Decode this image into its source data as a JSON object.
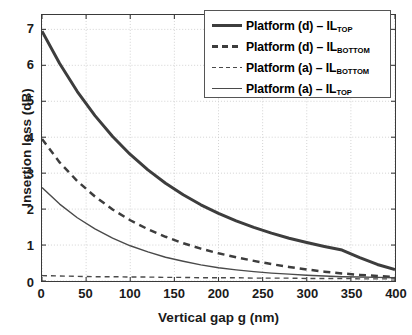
{
  "chart_data": {
    "type": "line",
    "title": "",
    "xlabel": "Vertical gap g (nm)",
    "ylabel": "Insertion loss (dB)",
    "xlim": [
      0,
      400
    ],
    "ylim": [
      0,
      7.4
    ],
    "xticks": [
      0,
      50,
      100,
      150,
      200,
      250,
      300,
      350,
      400
    ],
    "yticks": [
      0,
      1,
      2,
      3,
      4,
      5,
      6,
      7
    ],
    "grid": true,
    "legend_position": "upper right",
    "x": [
      0,
      20,
      40,
      60,
      80,
      100,
      120,
      140,
      160,
      180,
      200,
      220,
      240,
      260,
      280,
      300,
      320,
      340,
      360,
      380,
      400
    ],
    "series": [
      {
        "name": "Platform (d) – IL_TOP",
        "label_main": "Platform (d) – IL",
        "label_sub": "TOP",
        "style": "solid",
        "width": 3.0,
        "color": "#3d3d3d",
        "values": [
          6.95,
          6.05,
          5.27,
          4.6,
          4.02,
          3.52,
          3.09,
          2.72,
          2.4,
          2.12,
          1.88,
          1.67,
          1.49,
          1.33,
          1.19,
          1.07,
          0.96,
          0.86,
          0.65,
          0.46,
          0.32
        ]
      },
      {
        "name": "Platform (d) – IL_BOTTOM",
        "label_main": "Platform (d) – IL",
        "label_sub": "BOTTOM",
        "style": "dashed",
        "width": 2.5,
        "color": "#3d3d3d",
        "values": [
          3.95,
          3.3,
          2.78,
          2.35,
          1.99,
          1.69,
          1.44,
          1.23,
          1.05,
          0.9,
          0.77,
          0.66,
          0.56,
          0.47,
          0.39,
          0.32,
          0.26,
          0.21,
          0.17,
          0.14,
          0.11
        ]
      },
      {
        "name": "Platform (a) – IL_BOTTOM",
        "label_main": "Platform (a) – IL",
        "label_sub": "BOTTOM",
        "style": "dashed",
        "width": 1.4,
        "color": "#4a4a4a",
        "values": [
          0.15,
          0.14,
          0.13,
          0.12,
          0.12,
          0.11,
          0.11,
          0.1,
          0.1,
          0.09,
          0.09,
          0.09,
          0.08,
          0.08,
          0.08,
          0.07,
          0.07,
          0.07,
          0.06,
          0.06,
          0.06
        ]
      },
      {
        "name": "Platform (a) – IL_TOP",
        "label_main": "Platform (a) – IL",
        "label_sub": "TOP",
        "style": "solid",
        "width": 1.4,
        "color": "#4a4a4a",
        "values": [
          2.6,
          2.14,
          1.76,
          1.45,
          1.19,
          0.98,
          0.81,
          0.66,
          0.55,
          0.45,
          0.37,
          0.31,
          0.26,
          0.22,
          0.19,
          0.16,
          0.14,
          0.12,
          0.11,
          0.1,
          0.09
        ]
      }
    ]
  }
}
